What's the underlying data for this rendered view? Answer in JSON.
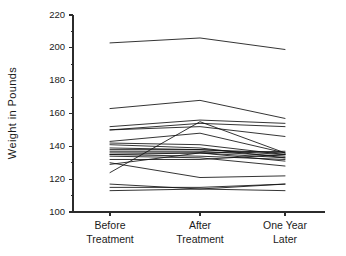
{
  "chart_data": {
    "type": "line",
    "title": "",
    "subtitle": "",
    "xlabel": "",
    "ylabel": "Weight in Pounds",
    "categories": [
      "Before Treatment",
      "After Treatment",
      "One Year Later"
    ],
    "category_lines": [
      [
        "Before",
        "Treatment"
      ],
      [
        "After",
        "Treatment"
      ],
      [
        "One Year",
        "Later"
      ]
    ],
    "ylim": [
      100,
      220
    ],
    "ytick_values": [
      100,
      120,
      140,
      160,
      180,
      200,
      220
    ],
    "ytick_labels": [
      "100",
      "120",
      "140",
      "160",
      "180",
      "200",
      "220"
    ],
    "yminor_values": [
      110,
      130,
      150,
      170,
      190,
      210
    ],
    "grid": false,
    "legend_position": "none",
    "series_label": "subject",
    "series_count": 22,
    "series": [
      {
        "name": "S1",
        "values": [
          203,
          206,
          199
        ]
      },
      {
        "name": "S2",
        "values": [
          163,
          168,
          157
        ]
      },
      {
        "name": "S3",
        "values": [
          152,
          156,
          154
        ]
      },
      {
        "name": "S4",
        "values": [
          150,
          154,
          152
        ]
      },
      {
        "name": "S5",
        "values": [
          150,
          152,
          146
        ]
      },
      {
        "name": "S6",
        "values": [
          143,
          148,
          136
        ]
      },
      {
        "name": "S7",
        "values": [
          142,
          141,
          135
        ]
      },
      {
        "name": "S8",
        "values": [
          141,
          139,
          133
        ]
      },
      {
        "name": "S9",
        "values": [
          139,
          138,
          135
        ]
      },
      {
        "name": "S10",
        "values": [
          138,
          138,
          136
        ]
      },
      {
        "name": "S11",
        "values": [
          137,
          137,
          134
        ]
      },
      {
        "name": "S12",
        "values": [
          136,
          136,
          133
        ]
      },
      {
        "name": "S13",
        "values": [
          135,
          136,
          137
        ]
      },
      {
        "name": "S14",
        "values": [
          135,
          134,
          132
        ]
      },
      {
        "name": "S15",
        "values": [
          134,
          133,
          128
        ]
      },
      {
        "name": "S16",
        "values": [
          132,
          132,
          135
        ]
      },
      {
        "name": "S17",
        "values": [
          130,
          121,
          122
        ]
      },
      {
        "name": "S18",
        "values": [
          129,
          136,
          131
        ]
      },
      {
        "name": "S19",
        "values": [
          124,
          155,
          136
        ]
      },
      {
        "name": "S20",
        "values": [
          117,
          114,
          117
        ]
      },
      {
        "name": "S21",
        "values": [
          115,
          115,
          117
        ]
      },
      {
        "name": "S22",
        "values": [
          113,
          114,
          113
        ]
      }
    ]
  },
  "axis": {
    "y_title": "Weight in Pounds"
  }
}
